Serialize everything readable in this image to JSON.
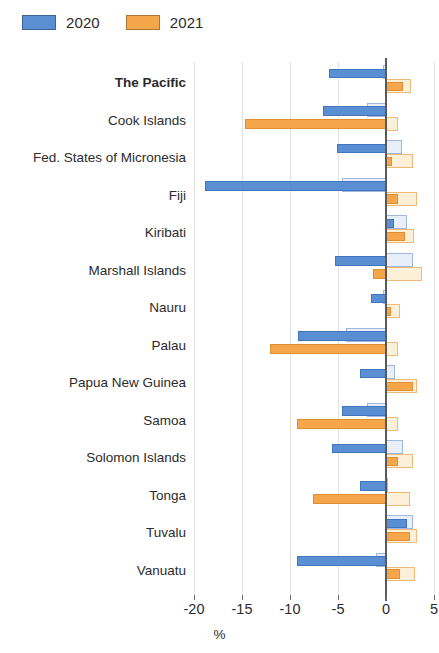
{
  "legend": {
    "items": [
      {
        "label": "2020",
        "color": "#5b8fd4"
      },
      {
        "label": "2021",
        "color": "#f5a64b"
      }
    ]
  },
  "axis": {
    "title": "%",
    "ticks": [
      "-20",
      "-15",
      "-10",
      "-5",
      "0",
      "5"
    ]
  },
  "chart_data": {
    "type": "bar",
    "orientation": "horizontal",
    "title": "",
    "xlabel": "%",
    "ylabel": "",
    "xlim": [
      -21,
      5.5
    ],
    "grid": true,
    "legend_position": "top-left",
    "tick_values": [
      -20,
      -15,
      -10,
      -5,
      0,
      5
    ],
    "categories": [
      "The Pacific",
      "Cook Islands",
      "Fed. States of Micronesia",
      "Fiji",
      "Kiribati",
      "Marshall Islands",
      "Nauru",
      "Palau",
      "Papua New Guinea",
      "Samoa",
      "Solomon Islands",
      "Tonga",
      "Tuvalu",
      "Vanuatu"
    ],
    "highlight_category": "The Pacific",
    "series": [
      {
        "name": "2020",
        "style": "solid",
        "color": "#5b8fd4",
        "values": [
          -5.9,
          -6.6,
          -5.1,
          -18.9,
          0.8,
          -5.3,
          -1.6,
          -9.2,
          -2.7,
          -4.6,
          -5.6,
          -2.7,
          2.2,
          -9.3
        ]
      },
      {
        "name": "2020 (projection)",
        "style": "outline",
        "color": "#e8eefa",
        "values": [
          -0.3,
          -2.0,
          1.7,
          -4.6,
          2.2,
          2.8,
          -0.3,
          -4.2,
          0.9,
          -2.0,
          1.8,
          0.2,
          2.8,
          -1.0
        ]
      },
      {
        "name": "2021",
        "style": "solid",
        "color": "#f5a64b",
        "values": [
          1.8,
          -14.7,
          0.6,
          1.3,
          2.0,
          -1.4,
          0.5,
          -12.1,
          2.8,
          -9.3,
          1.3,
          -7.6,
          2.5,
          1.5
        ]
      },
      {
        "name": "2021 (projection)",
        "style": "outline",
        "color": "#fdf0d8",
        "values": [
          2.6,
          1.3,
          2.8,
          3.2,
          2.9,
          3.7,
          1.5,
          1.2,
          3.2,
          1.2,
          2.8,
          2.5,
          3.2,
          3.0
        ]
      }
    ]
  }
}
